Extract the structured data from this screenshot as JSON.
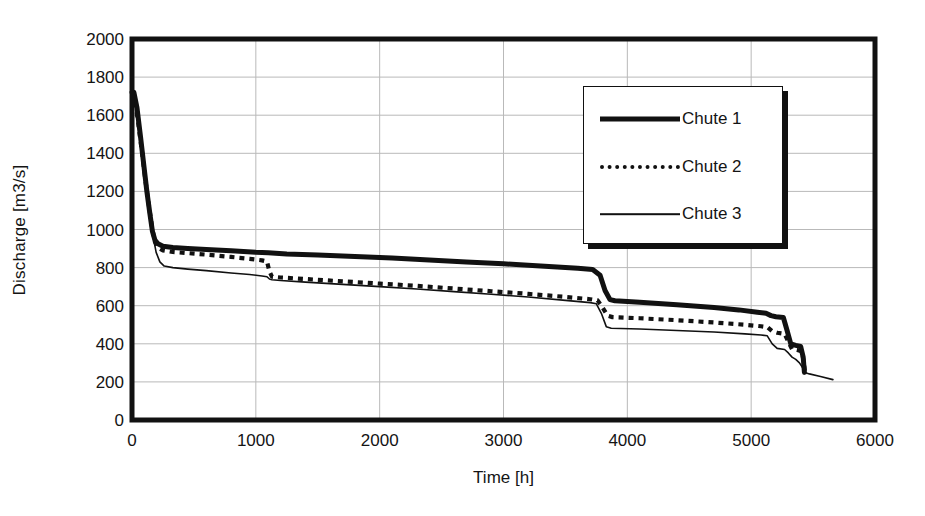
{
  "chart_data": {
    "type": "line",
    "title": "",
    "subtitle": "",
    "xlabel": "Time [h]",
    "ylabel": "Discharge [m3/s]",
    "xlim": [
      0,
      6000
    ],
    "ylim": [
      0,
      2000
    ],
    "xticks": [
      0,
      1000,
      2000,
      3000,
      4000,
      5000,
      6000
    ],
    "yticks": [
      0,
      200,
      400,
      600,
      800,
      1000,
      1200,
      1400,
      1600,
      1800,
      2000
    ],
    "grid": "horizontal-and-vertical",
    "grid_color": "#b9b9b9",
    "frame_color": "#111111",
    "legend_position": "upper-right-inside",
    "series": [
      {
        "name": "Chute 1",
        "style": "thick-solid",
        "color": "#111111",
        "points": [
          [
            0,
            1720
          ],
          [
            15,
            1720
          ],
          [
            40,
            1640
          ],
          [
            70,
            1480
          ],
          [
            95,
            1340
          ],
          [
            120,
            1200
          ],
          [
            145,
            1080
          ],
          [
            165,
            990
          ],
          [
            185,
            945
          ],
          [
            210,
            925
          ],
          [
            250,
            912
          ],
          [
            330,
            905
          ],
          [
            450,
            900
          ],
          [
            600,
            895
          ],
          [
            800,
            888
          ],
          [
            1000,
            880
          ],
          [
            1100,
            878
          ],
          [
            1250,
            872
          ],
          [
            1500,
            866
          ],
          [
            1800,
            858
          ],
          [
            2100,
            850
          ],
          [
            2400,
            840
          ],
          [
            2700,
            830
          ],
          [
            3000,
            820
          ],
          [
            3300,
            808
          ],
          [
            3600,
            796
          ],
          [
            3720,
            790
          ],
          [
            3780,
            760
          ],
          [
            3820,
            680
          ],
          [
            3860,
            632
          ],
          [
            3900,
            626
          ],
          [
            4100,
            618
          ],
          [
            4400,
            605
          ],
          [
            4700,
            590
          ],
          [
            4900,
            578
          ],
          [
            5050,
            566
          ],
          [
            5120,
            560
          ],
          [
            5160,
            548
          ],
          [
            5200,
            542
          ],
          [
            5260,
            538
          ],
          [
            5290,
            470
          ],
          [
            5320,
            400
          ],
          [
            5360,
            392
          ],
          [
            5400,
            386
          ],
          [
            5420,
            330
          ],
          [
            5430,
            250
          ]
        ]
      },
      {
        "name": "Chute 2",
        "style": "dotted",
        "color": "#111111",
        "points": [
          [
            0,
            1715
          ],
          [
            20,
            1700
          ],
          [
            50,
            1560
          ],
          [
            80,
            1410
          ],
          [
            110,
            1250
          ],
          [
            140,
            1110
          ],
          [
            165,
            1000
          ],
          [
            185,
            935
          ],
          [
            210,
            905
          ],
          [
            250,
            890
          ],
          [
            330,
            882
          ],
          [
            450,
            876
          ],
          [
            600,
            868
          ],
          [
            800,
            856
          ],
          [
            950,
            846
          ],
          [
            1050,
            838
          ],
          [
            1090,
            832
          ],
          [
            1110,
            780
          ],
          [
            1130,
            752
          ],
          [
            1200,
            748
          ],
          [
            1400,
            740
          ],
          [
            1700,
            728
          ],
          [
            2000,
            716
          ],
          [
            2300,
            704
          ],
          [
            2600,
            690
          ],
          [
            2900,
            676
          ],
          [
            3200,
            662
          ],
          [
            3500,
            646
          ],
          [
            3700,
            634
          ],
          [
            3760,
            628
          ],
          [
            3800,
            590
          ],
          [
            3840,
            548
          ],
          [
            3880,
            540
          ],
          [
            4100,
            534
          ],
          [
            4400,
            524
          ],
          [
            4700,
            512
          ],
          [
            4950,
            500
          ],
          [
            5080,
            492
          ],
          [
            5130,
            488
          ],
          [
            5170,
            466
          ],
          [
            5210,
            458
          ],
          [
            5270,
            452
          ],
          [
            5300,
            412
          ],
          [
            5330,
            372
          ],
          [
            5380,
            366
          ],
          [
            5410,
            360
          ],
          [
            5425,
            300
          ],
          [
            5435,
            250
          ]
        ]
      },
      {
        "name": "Chute 3",
        "style": "thin-solid",
        "color": "#111111",
        "points": [
          [
            0,
            1710
          ],
          [
            25,
            1670
          ],
          [
            55,
            1520
          ],
          [
            85,
            1370
          ],
          [
            115,
            1210
          ],
          [
            145,
            1070
          ],
          [
            170,
            965
          ],
          [
            195,
            880
          ],
          [
            225,
            830
          ],
          [
            260,
            808
          ],
          [
            330,
            800
          ],
          [
            450,
            792
          ],
          [
            600,
            784
          ],
          [
            800,
            772
          ],
          [
            950,
            764
          ],
          [
            1050,
            756
          ],
          [
            1090,
            752
          ],
          [
            1110,
            740
          ],
          [
            1130,
            736
          ],
          [
            1200,
            732
          ],
          [
            1400,
            724
          ],
          [
            1700,
            712
          ],
          [
            2000,
            700
          ],
          [
            2300,
            688
          ],
          [
            2600,
            674
          ],
          [
            2900,
            660
          ],
          [
            3200,
            646
          ],
          [
            3500,
            628
          ],
          [
            3700,
            616
          ],
          [
            3750,
            610
          ],
          [
            3790,
            560
          ],
          [
            3830,
            490
          ],
          [
            3870,
            482
          ],
          [
            4100,
            478
          ],
          [
            4400,
            470
          ],
          [
            4700,
            462
          ],
          [
            4950,
            452
          ],
          [
            5080,
            446
          ],
          [
            5130,
            442
          ],
          [
            5170,
            400
          ],
          [
            5210,
            376
          ],
          [
            5270,
            370
          ],
          [
            5300,
            352
          ],
          [
            5330,
            330
          ],
          [
            5360,
            318
          ],
          [
            5390,
            300
          ],
          [
            5420,
            270
          ],
          [
            5440,
            248
          ],
          [
            5470,
            242
          ],
          [
            5560,
            228
          ],
          [
            5660,
            212
          ]
        ]
      }
    ]
  },
  "axis": {
    "ylabel": "Discharge [m3/s]",
    "xlabel": "Time [h]",
    "yticks": [
      "2000",
      "1800",
      "1600",
      "1400",
      "1200",
      "1000",
      "800",
      "600",
      "400",
      "200",
      "0"
    ],
    "xticks": [
      "0",
      "1000",
      "2000",
      "3000",
      "4000",
      "5000",
      "6000"
    ]
  },
  "legend": {
    "items": [
      {
        "label": "Chute 1",
        "style": "thick-solid"
      },
      {
        "label": "Chute 2",
        "style": "dotted"
      },
      {
        "label": "Chute 3",
        "style": "thin-solid"
      }
    ]
  }
}
